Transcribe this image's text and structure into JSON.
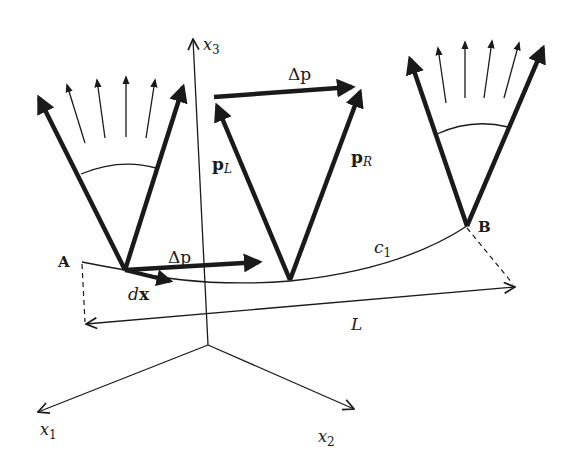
{
  "diagram": {
    "axes": {
      "x1": {
        "label": "x",
        "sub": "1"
      },
      "x2": {
        "label": "x",
        "sub": "2"
      },
      "x3": {
        "label": "x",
        "sub": "3"
      }
    },
    "points": {
      "A": "A",
      "B": "B"
    },
    "labels": {
      "delta_p_top": "Δp",
      "delta_p_bottom": "Δp",
      "pL_main": "p",
      "pL_sub": "L",
      "pR_main": "p",
      "pR_sub": "R",
      "curve_main": "c",
      "curve_sub": "1",
      "dx_d": "d",
      "dx_x": "x",
      "length": "L"
    },
    "colors": {
      "stroke": "#1a1a1a",
      "background": "#ffffff"
    }
  }
}
